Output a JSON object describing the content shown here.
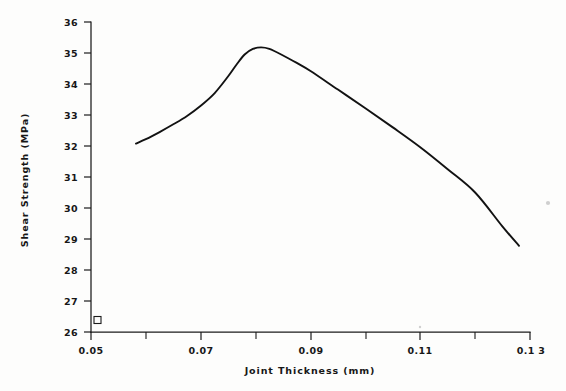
{
  "figure": {
    "background_color": "#fdfdfc",
    "ink_color": "#121212",
    "width": 566,
    "height": 391
  },
  "chart_data": {
    "type": "line",
    "title": "",
    "subtitle": "",
    "xlabel": "Joint Thickness (mm)",
    "ylabel": "Shear Strength (MPa)",
    "xlim": [
      0.05,
      0.13
    ],
    "ylim": [
      26,
      36
    ],
    "grid": false,
    "legend": null,
    "x_major_ticks": [
      0.05,
      0.07,
      0.09,
      0.11,
      0.13
    ],
    "x_major_tick_labels": [
      "0.05",
      "0.07",
      "0.09",
      "0.11",
      "0.1 3"
    ],
    "x_minor_ticks": [
      0.06,
      0.08,
      0.1,
      0.12
    ],
    "y_major_ticks": [
      26,
      27,
      28,
      29,
      30,
      31,
      32,
      33,
      34,
      35,
      36
    ],
    "y_major_tick_labels": [
      "26",
      "27",
      "28",
      "29",
      "30",
      "31",
      "32",
      "33",
      "34",
      "35",
      "36"
    ],
    "series": [
      {
        "name": "Shear strength vs joint thickness",
        "style": "smooth-curve",
        "x": [
          0.0582,
          0.06,
          0.0625,
          0.065,
          0.0675,
          0.07,
          0.0725,
          0.075,
          0.0765,
          0.078,
          0.0795,
          0.081,
          0.0825,
          0.085,
          0.0875,
          0.09,
          0.095,
          0.1,
          0.105,
          0.11,
          0.115,
          0.12,
          0.125,
          0.128
        ],
        "y": [
          32.08,
          32.22,
          32.45,
          32.7,
          32.97,
          33.3,
          33.7,
          34.25,
          34.62,
          34.95,
          35.13,
          35.18,
          35.13,
          34.92,
          34.68,
          34.42,
          33.82,
          33.22,
          32.6,
          31.96,
          31.25,
          30.5,
          29.4,
          28.78
        ]
      }
    ],
    "annotations": [
      {
        "name": "origin-square-marker",
        "shape": "open-square",
        "x": 0.0512,
        "y": 26.38,
        "size_px": 7
      }
    ]
  },
  "axes": {
    "x_axis_name": "joint-thickness-axis",
    "y_axis_name": "shear-strength-axis"
  }
}
